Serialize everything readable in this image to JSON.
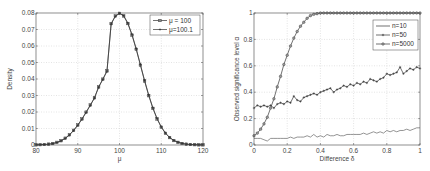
{
  "chart_data": [
    {
      "type": "line",
      "title": "",
      "xlabel": "μ",
      "ylabel": "Density",
      "xlim": [
        80,
        120
      ],
      "ylim": [
        0,
        0.08
      ],
      "xticks": [
        80,
        90,
        100,
        110,
        120
      ],
      "yticks": [
        0,
        0.01,
        0.02,
        0.03,
        0.04,
        0.05,
        0.06,
        0.07,
        0.08
      ],
      "grid": true,
      "legend_position": "upper right",
      "x": [
        80,
        81,
        82,
        83,
        84,
        85,
        86,
        87,
        88,
        89,
        90,
        91,
        92,
        93,
        94,
        95,
        96,
        97,
        98,
        99,
        100,
        101,
        102,
        103,
        104,
        105,
        106,
        107,
        108,
        109,
        110,
        111,
        112,
        113,
        114,
        115,
        116,
        117,
        118,
        119,
        120
      ],
      "series": [
        {
          "name": "μ = 100",
          "marker": "square",
          "values": [
            0.0001,
            0.0002,
            0.0003,
            0.0005,
            0.0009,
            0.0016,
            0.0026,
            0.0041,
            0.0062,
            0.0089,
            0.0121,
            0.0158,
            0.0199,
            0.0242,
            0.0286,
            0.0352,
            0.0399,
            0.0449,
            0.0736,
            0.0782,
            0.0798,
            0.0782,
            0.0736,
            0.0666,
            0.058,
            0.0484,
            0.0388,
            0.0299,
            0.0222,
            0.0158,
            0.0108,
            0.0071,
            0.0045,
            0.0027,
            0.0016,
            0.0009,
            0.0005,
            0.0003,
            0.0002,
            0.0001,
            0.0001
          ]
        },
        {
          "name": "μ=100.1",
          "marker": "plus",
          "values": [
            0.0001,
            0.0002,
            0.0003,
            0.0005,
            0.0008,
            0.0015,
            0.0025,
            0.004,
            0.006,
            0.0087,
            0.0119,
            0.0156,
            0.0197,
            0.024,
            0.0284,
            0.035,
            0.0397,
            0.0447,
            0.0733,
            0.078,
            0.0798,
            0.0784,
            0.0739,
            0.0669,
            0.0584,
            0.0488,
            0.0392,
            0.0303,
            0.0225,
            0.0161,
            0.011,
            0.0073,
            0.0046,
            0.0028,
            0.0017,
            0.001,
            0.0005,
            0.0003,
            0.0002,
            0.0001,
            0.0001
          ]
        }
      ]
    },
    {
      "type": "line",
      "title": "",
      "xlabel": "Difference δ",
      "ylabel": "Observed significance level  α",
      "xlim": [
        0,
        1
      ],
      "ylim": [
        0,
        1
      ],
      "xticks": [
        0,
        0.2,
        0.4,
        0.6,
        0.8,
        1
      ],
      "yticks": [
        0,
        0.2,
        0.4,
        0.6,
        0.8,
        1
      ],
      "grid": true,
      "legend_position": "upper right",
      "x": [
        0,
        0.02,
        0.04,
        0.06,
        0.08,
        0.1,
        0.12,
        0.14,
        0.16,
        0.18,
        0.2,
        0.22,
        0.24,
        0.26,
        0.28,
        0.3,
        0.32,
        0.34,
        0.36,
        0.38,
        0.4,
        0.42,
        0.44,
        0.46,
        0.48,
        0.5,
        0.52,
        0.54,
        0.56,
        0.58,
        0.6,
        0.62,
        0.64,
        0.66,
        0.68,
        0.7,
        0.72,
        0.74,
        0.76,
        0.78,
        0.8,
        0.82,
        0.84,
        0.86,
        0.88,
        0.9,
        0.92,
        0.94,
        0.96,
        0.98,
        1.0
      ],
      "series": [
        {
          "name": "n=10",
          "marker": "none",
          "values": [
            0.05,
            0.05,
            0.05,
            0.04,
            0.03,
            0.05,
            0.05,
            0.05,
            0.05,
            0.05,
            0.05,
            0.06,
            0.05,
            0.06,
            0.06,
            0.06,
            0.07,
            0.06,
            0.08,
            0.06,
            0.07,
            0.06,
            0.08,
            0.07,
            0.07,
            0.08,
            0.07,
            0.07,
            0.08,
            0.08,
            0.08,
            0.08,
            0.08,
            0.09,
            0.08,
            0.09,
            0.1,
            0.09,
            0.1,
            0.09,
            0.11,
            0.1,
            0.11,
            0.1,
            0.11,
            0.11,
            0.12,
            0.11,
            0.12,
            0.13,
            0.13
          ]
        },
        {
          "name": "n=50",
          "marker": "plus",
          "values": [
            0.28,
            0.3,
            0.29,
            0.3,
            0.29,
            0.3,
            0.28,
            0.31,
            0.32,
            0.31,
            0.33,
            0.32,
            0.37,
            0.34,
            0.33,
            0.36,
            0.37,
            0.38,
            0.39,
            0.38,
            0.4,
            0.41,
            0.42,
            0.43,
            0.4,
            0.42,
            0.43,
            0.45,
            0.44,
            0.46,
            0.45,
            0.47,
            0.46,
            0.48,
            0.47,
            0.5,
            0.49,
            0.48,
            0.5,
            0.51,
            0.54,
            0.53,
            0.54,
            0.55,
            0.59,
            0.54,
            0.56,
            0.58,
            0.57,
            0.59,
            0.58
          ]
        },
        {
          "name": "n=5000",
          "marker": "circle",
          "values": [
            0.07,
            0.09,
            0.12,
            0.16,
            0.21,
            0.28,
            0.35,
            0.44,
            0.52,
            0.61,
            0.68,
            0.75,
            0.81,
            0.86,
            0.9,
            0.93,
            0.96,
            0.98,
            0.99,
            0.995,
            1,
            1,
            1,
            1,
            1,
            1,
            1,
            1,
            1,
            1,
            1,
            1,
            1,
            1,
            1,
            1,
            1,
            1,
            1,
            1,
            1,
            1,
            1,
            1,
            1,
            1,
            1,
            1,
            1,
            1,
            1
          ]
        }
      ]
    }
  ]
}
